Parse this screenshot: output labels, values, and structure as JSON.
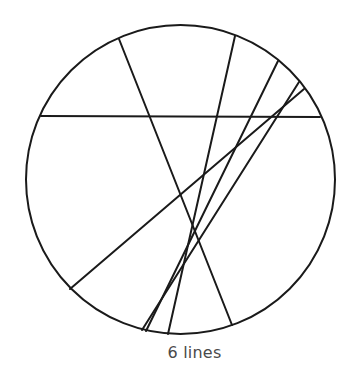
{
  "diagram": {
    "caption": "6 lines",
    "stroke_color": "#1a1a1a",
    "stroke_width": 2,
    "circle": {
      "cx": 180.5,
      "cy": 179.5,
      "r": 154.5
    },
    "lines": [
      {
        "id": "line-1",
        "x1": 41,
        "y1": 116,
        "x2": 320,
        "y2": 117
      },
      {
        "id": "line-2",
        "x1": 119,
        "y1": 39,
        "x2": 232,
        "y2": 325
      },
      {
        "id": "line-3",
        "x1": 235,
        "y1": 36,
        "x2": 168,
        "y2": 334
      },
      {
        "id": "line-4",
        "x1": 278,
        "y1": 61,
        "x2": 146,
        "y2": 331
      },
      {
        "id": "line-5",
        "x1": 299,
        "y1": 82,
        "x2": 142,
        "y2": 330
      },
      {
        "id": "line-6",
        "x1": 304,
        "y1": 89,
        "x2": 70,
        "y2": 289
      }
    ]
  }
}
